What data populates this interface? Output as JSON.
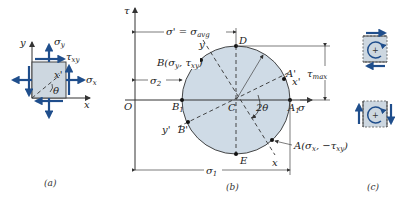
{
  "figure": {
    "panel_a": {
      "caption": "(a)",
      "labels": {
        "y_axis": "y",
        "x_axis": "x",
        "sigma_y": "σ",
        "sigma_y_sub": "y",
        "tau_xy": "τ",
        "tau_xy_sub": "xy",
        "sigma_x": "σ",
        "sigma_x_sub": "x",
        "x_prime": "x'",
        "theta": "θ"
      }
    },
    "panel_b": {
      "caption": "(b)",
      "labels": {
        "tau_axis": "τ",
        "sigma_axis": "σ",
        "origin": "O",
        "center": "C",
        "D": "D",
        "E": "E",
        "A1": "A",
        "A1_sub": "1",
        "B1": "B",
        "B1_sub": "1",
        "A_prime": "A'",
        "x_prime": "x'",
        "B_prime": "B'",
        "y_prime": "y'",
        "y_line": "y",
        "x_line": "x",
        "two_theta": "2θ",
        "point_B": "B(σ",
        "point_B_y": "y",
        "point_B_mid": ", τ",
        "point_B_xy": "xy",
        "point_B_end": ")",
        "point_A": "A(σ",
        "point_A_x": "x",
        "point_A_mid": ", −τ",
        "point_A_xy": "xy",
        "point_A_end": ")",
        "sigma_prime_avg": "σ' = σ",
        "sigma_prime_avg_sub": "avg",
        "sigma_2": "σ",
        "sigma_2_sub": "2",
        "sigma_1": "σ",
        "sigma_1_sub": "1",
        "tau_max": "τ",
        "tau_max_sub": "max"
      }
    },
    "panel_c": {
      "caption": "(c)",
      "element_top_symbol": "+",
      "element_bottom_symbol": "+"
    },
    "colors": {
      "circle_fill": "#cfdbe6",
      "element_fill": "#cdd7e0",
      "arrow_blue": "#1f4e8c",
      "line": "#333333"
    }
  }
}
